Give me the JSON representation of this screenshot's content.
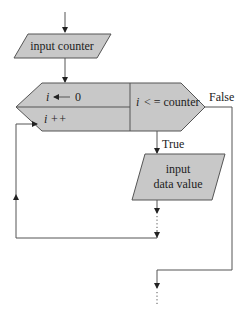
{
  "diagram": {
    "type": "flowchart",
    "title": "",
    "nodes": [
      {
        "id": "input-counter",
        "shape": "parallelogram",
        "label": "input counter"
      },
      {
        "id": "loop-init",
        "shape": "loop-hexagon-left-top",
        "var": "i",
        "op": "←",
        "value": "0"
      },
      {
        "id": "loop-increment",
        "shape": "loop-hexagon-left-bottom",
        "label": "i ++"
      },
      {
        "id": "loop-condition",
        "shape": "loop-hexagon-right",
        "var": "i",
        "label": " < = counter"
      },
      {
        "id": "input-data",
        "shape": "parallelogram",
        "line1": "input",
        "line2": "data value"
      }
    ],
    "edges": [
      {
        "from": "start",
        "to": "input-counter"
      },
      {
        "from": "input-counter",
        "to": "loop-init"
      },
      {
        "from": "loop-condition",
        "to": "input-data",
        "label": "True"
      },
      {
        "from": "loop-condition",
        "to": "exit",
        "label": "False"
      },
      {
        "from": "input-data",
        "to": "loop-increment",
        "label": ""
      }
    ],
    "labels": {
      "true": "True",
      "false": "False"
    },
    "colors": {
      "shape_fill": "#c8c8c8",
      "stroke": "#555555",
      "text": "#222222",
      "background": "#ffffff"
    }
  }
}
